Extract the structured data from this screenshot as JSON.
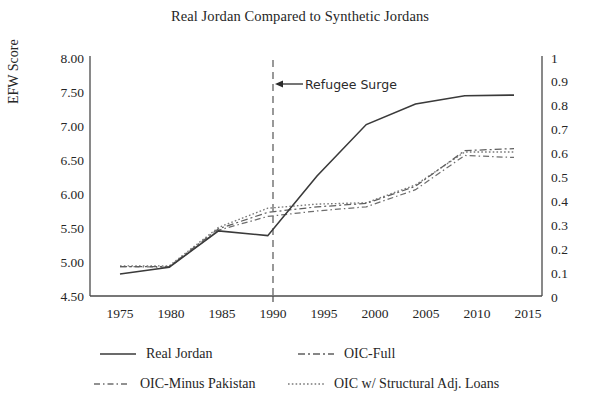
{
  "chart_data": {
    "type": "line",
    "title": "Real Jordan Compared to Synthetic Jordans",
    "xlabel": "",
    "ylabel": "EFW Score",
    "y2label": "",
    "x": [
      1975,
      1980,
      1985,
      1990,
      1995,
      2000,
      2005,
      2010,
      2015
    ],
    "xticklabels": [
      "1975",
      "1980",
      "1985",
      "1990",
      "1995",
      "2000",
      "2005",
      "2010",
      "2015"
    ],
    "xlim": [
      1973,
      2017
    ],
    "ylim": [
      4.5,
      8.0
    ],
    "yticklabels": [
      "8.00",
      "7.50",
      "7.00",
      "6.50",
      "6.00",
      "5.50",
      "5.00",
      "4.50"
    ],
    "yticks": [
      8.0,
      7.5,
      7.0,
      6.5,
      6.0,
      5.5,
      5.0,
      4.5
    ],
    "y2lim": [
      0,
      1
    ],
    "y2ticklabels": [
      "1",
      "0.9",
      "0.8",
      "0.7",
      "0.6",
      "0.5",
      "0.4",
      "0.3",
      "0.2",
      "0.1",
      "0"
    ],
    "y2ticks": [
      1,
      0.9,
      0.8,
      0.7,
      0.6,
      0.5,
      0.4,
      0.3,
      0.2,
      0.1,
      0
    ],
    "grid": false,
    "legend_position": "below-axes",
    "series": [
      {
        "name": "Real Jordan",
        "style": "solid",
        "axis": "left",
        "values": [
          4.82,
          4.92,
          5.45,
          5.38,
          6.25,
          7.0,
          7.3,
          7.42,
          7.43
        ]
      },
      {
        "name": "OIC-Full",
        "style": "dash-dot",
        "axis": "left",
        "values": [
          4.93,
          4.93,
          5.48,
          5.72,
          5.8,
          5.85,
          6.1,
          6.62,
          6.65
        ]
      },
      {
        "name": "OIC-Minus Pakistan",
        "style": "dash-dot-fine",
        "axis": "left",
        "values": [
          4.93,
          4.92,
          5.46,
          5.66,
          5.74,
          5.8,
          6.05,
          6.55,
          6.52
        ]
      },
      {
        "name": "OIC w/ Structural Adj. Loans",
        "style": "dotted",
        "axis": "left",
        "values": [
          4.94,
          4.94,
          5.5,
          5.78,
          5.84,
          5.86,
          6.12,
          6.6,
          6.6
        ]
      }
    ],
    "annotations": [
      {
        "text": "Refugee Surge",
        "x": 1990,
        "y": 7.55,
        "marker": "left-arrow",
        "vline_x": 1990,
        "vline_style": "dashed"
      }
    ]
  }
}
